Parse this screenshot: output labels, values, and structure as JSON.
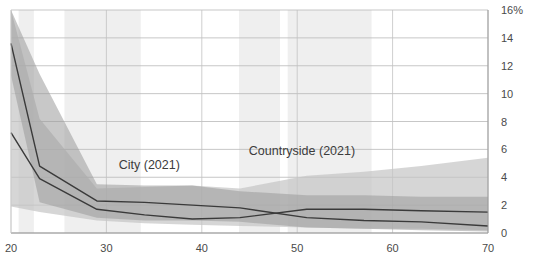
{
  "chart_data": {
    "type": "line",
    "title": "",
    "subtitle": "",
    "xlabel": "",
    "ylabel": "",
    "xlim": [
      20,
      70
    ],
    "ylim": [
      0,
      16
    ],
    "grid": true,
    "grid_axis": "y",
    "legend_position": "inline-annotations",
    "y_tick_values": [
      0,
      2,
      4,
      6,
      8,
      10,
      12,
      14,
      16
    ],
    "y_tick_labels": [
      "0",
      "2",
      "4",
      "6",
      "8",
      "10",
      "12",
      "14",
      "16%"
    ],
    "y_axis_side": "right",
    "x_tick_values": [
      20,
      30,
      40,
      50,
      60,
      70
    ],
    "x_tick_labels": [
      "20",
      "30",
      "40",
      "50",
      "60",
      "70"
    ],
    "annotations": [
      {
        "text": "City (2021)",
        "x": 34.5,
        "y": 4.6
      },
      {
        "text": "Countryside (2021)",
        "x": 50.5,
        "y": 5.6
      }
    ],
    "series": [
      {
        "name": "City (2021)",
        "color": "#3a3a3a",
        "band_color": "#9a9a9a",
        "band_opacity": 0.55,
        "x": [
          20,
          23,
          29,
          34,
          39,
          44,
          51,
          57,
          63,
          70
        ],
        "values": [
          13.6,
          4.8,
          2.3,
          2.2,
          2.0,
          1.8,
          1.1,
          0.9,
          0.8,
          0.5
        ],
        "band_upper": [
          16.0,
          11.4,
          3.5,
          3.4,
          3.4,
          3.0,
          2.7,
          2.7,
          2.6,
          2.6
        ],
        "band_lower": [
          11.3,
          2.2,
          1.1,
          0.9,
          0.9,
          0.8,
          0.4,
          0.3,
          0.2,
          0.1
        ]
      },
      {
        "name": "Countryside (2021)",
        "color": "#3a3a3a",
        "band_color": "#c4c4c4",
        "band_opacity": 0.7,
        "x": [
          20,
          23,
          29,
          34,
          39,
          44,
          51,
          57,
          63,
          70
        ],
        "values": [
          7.2,
          3.9,
          1.7,
          1.3,
          1.0,
          1.1,
          1.7,
          1.7,
          1.6,
          1.5
        ],
        "band_upper": [
          16.0,
          8.2,
          3.2,
          3.3,
          3.4,
          3.2,
          4.1,
          4.4,
          4.8,
          5.4
        ],
        "band_lower": [
          1.9,
          1.5,
          0.9,
          0.7,
          0.6,
          0.5,
          0.4,
          0.3,
          0.3,
          0.2
        ]
      }
    ],
    "background_bands": [
      {
        "x0": 20.8,
        "x1": 22.4
      },
      {
        "x0": 25.6,
        "x1": 33.6
      },
      {
        "x0": 43.9,
        "x1": 48.2
      },
      {
        "x0": 49.0,
        "x1": 57.8
      }
    ]
  }
}
